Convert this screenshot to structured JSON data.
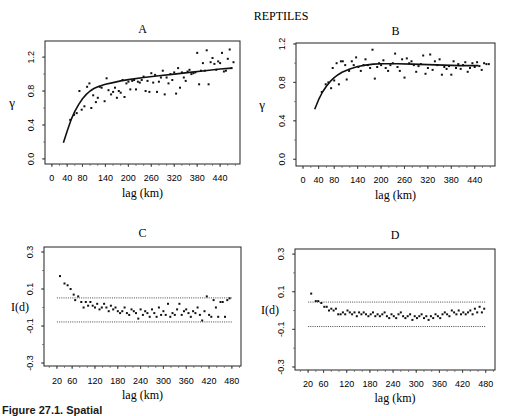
{
  "figure": {
    "main_title": "REPTILES",
    "caption_fragment": "Figure 27.1. Spatial"
  },
  "chart_data": [
    {
      "id": "A",
      "type": "scatter",
      "title": "A",
      "xlabel": "lag (km)",
      "ylabel": "γ",
      "xticks": [
        0,
        40,
        80,
        140,
        200,
        260,
        320,
        380,
        440
      ],
      "yticks": [
        0.0,
        0.4,
        0.8,
        1.2
      ],
      "ytick_labels": [
        "0.0",
        "0.4",
        "0.8",
        "1.2"
      ],
      "xlim": [
        -18,
        492
      ],
      "ylim": [
        -0.06,
        1.39
      ],
      "fit_curve": {
        "x": [
          30,
          40,
          50,
          60,
          70,
          80,
          90,
          100,
          110,
          120,
          140,
          160,
          180,
          200,
          240,
          280,
          320,
          360,
          400,
          440,
          470
        ],
        "y": [
          0.19,
          0.33,
          0.46,
          0.56,
          0.64,
          0.71,
          0.76,
          0.8,
          0.83,
          0.85,
          0.88,
          0.9,
          0.92,
          0.935,
          0.96,
          0.98,
          1.0,
          1.02,
          1.04,
          1.06,
          1.07
        ]
      },
      "points": {
        "x": [
          48,
          58,
          65,
          72,
          78,
          85,
          92,
          98,
          103,
          108,
          115,
          120,
          125,
          130,
          138,
          143,
          148,
          155,
          160,
          165,
          170,
          175,
          180,
          185,
          190,
          195,
          200,
          205,
          210,
          215,
          220,
          225,
          230,
          235,
          240,
          245,
          250,
          255,
          260,
          265,
          270,
          275,
          280,
          285,
          290,
          295,
          300,
          305,
          310,
          315,
          320,
          325,
          330,
          335,
          340,
          345,
          350,
          355,
          360,
          365,
          370,
          375,
          380,
          385,
          390,
          395,
          400,
          405,
          410,
          415,
          420,
          425,
          430,
          435,
          440,
          445,
          450,
          455,
          460,
          465,
          470,
          475
        ],
        "y": [
          0.46,
          0.52,
          0.54,
          0.8,
          0.58,
          0.62,
          0.85,
          0.89,
          0.6,
          0.75,
          0.67,
          0.72,
          0.85,
          0.84,
          0.68,
          0.95,
          0.81,
          0.76,
          0.79,
          0.84,
          0.72,
          0.8,
          0.78,
          0.93,
          0.73,
          0.89,
          0.91,
          0.82,
          0.92,
          0.93,
          0.82,
          0.91,
          0.9,
          0.93,
          0.97,
          0.8,
          0.92,
          0.79,
          1.01,
          0.9,
          0.99,
          0.79,
          0.91,
          0.96,
          1.04,
          0.76,
          0.96,
          0.89,
          1.0,
          0.93,
          1.02,
          0.77,
          1.07,
          0.84,
          1.02,
          0.96,
          0.92,
          1.03,
          1.05,
          1.0,
          1.01,
          1.02,
          1.25,
          0.88,
          1.04,
          1.13,
          1.04,
          1.28,
          0.88,
          1.14,
          1.19,
          1.12,
          1.05,
          1.15,
          1.13,
          1.25,
          1.03,
          1.04,
          1.18,
          1.29,
          1.07,
          1.14
        ]
      }
    },
    {
      "id": "B",
      "type": "scatter",
      "title": "B",
      "xlabel": "lag (km)",
      "ylabel": "γ",
      "xticks": [
        0,
        40,
        80,
        140,
        200,
        260,
        320,
        380,
        440
      ],
      "yticks": [
        0.0,
        0.4,
        0.8,
        1.2
      ],
      "ytick_labels": [
        "0.0",
        "0.4",
        "0.8",
        "1.2"
      ],
      "xlim": [
        -18,
        492
      ],
      "ylim": [
        -0.07,
        1.21
      ],
      "fit_curve": {
        "x": [
          30,
          40,
          50,
          60,
          70,
          80,
          90,
          100,
          120,
          140,
          160,
          180,
          200,
          240,
          280,
          320,
          360,
          400,
          440,
          450
        ],
        "y": [
          0.52,
          0.62,
          0.7,
          0.76,
          0.81,
          0.85,
          0.88,
          0.905,
          0.94,
          0.965,
          0.98,
          0.99,
          0.995,
          0.995,
          0.99,
          0.985,
          0.98,
          0.975,
          0.975,
          0.975
        ]
      },
      "points": {
        "x": [
          48,
          58,
          65,
          72,
          76,
          80,
          86,
          92,
          97,
          102,
          108,
          112,
          118,
          125,
          130,
          136,
          142,
          148,
          155,
          160,
          166,
          172,
          178,
          184,
          190,
          195,
          200,
          206,
          212,
          218,
          224,
          230,
          236,
          242,
          248,
          254,
          260,
          266,
          272,
          278,
          284,
          290,
          296,
          302,
          308,
          314,
          320,
          326,
          332,
          338,
          344,
          350,
          356,
          362,
          368,
          374,
          380,
          386,
          392,
          398,
          404,
          410,
          416,
          422,
          428,
          434,
          440,
          446,
          452,
          458,
          464,
          470,
          476
        ],
        "y": [
          0.7,
          0.78,
          0.8,
          0.74,
          0.95,
          0.82,
          1.0,
          0.78,
          1.02,
          1.02,
          0.98,
          0.83,
          0.92,
          1.02,
          0.98,
          1.06,
          0.96,
          0.92,
          0.98,
          1.04,
          0.98,
          0.95,
          1.14,
          0.84,
          0.96,
          1.0,
          0.98,
          1.03,
          0.95,
          0.92,
          0.98,
          1.0,
          1.1,
          0.96,
          0.92,
          1.04,
          0.85,
          1.05,
          1.0,
          1.02,
          0.98,
          0.91,
          0.97,
          0.99,
          1.08,
          0.89,
          0.95,
          1.09,
          0.93,
          1.02,
          0.98,
          1.04,
          0.88,
          0.96,
          0.94,
          0.97,
          0.88,
          1.02,
          0.95,
          0.99,
          0.94,
          0.98,
          1.01,
          0.91,
          0.95,
          1.0,
          0.96,
          1.01,
          0.97,
          0.93,
          1.0,
          0.99,
          0.99
        ]
      }
    },
    {
      "id": "C",
      "type": "scatter",
      "title": "C",
      "xlabel": "lag (km)",
      "ylabel": "I(d)",
      "xticks": [
        20,
        60,
        120,
        180,
        240,
        300,
        360,
        420,
        480
      ],
      "yticks": [
        -0.3,
        -0.1,
        0.1,
        0.3
      ],
      "ytick_labels": [
        "-0.3",
        "-0.1",
        "0.1",
        "0.3"
      ],
      "xlim": [
        -14,
        504
      ],
      "ylim": [
        -0.316,
        0.327
      ],
      "reference_lines": [
        0.052,
        -0.078
      ],
      "reference_line_xrange": [
        20,
        480
      ],
      "points": {
        "x": [
          28,
          40,
          48,
          56,
          64,
          68,
          76,
          84,
          90,
          96,
          102,
          108,
          114,
          120,
          126,
          132,
          138,
          144,
          150,
          156,
          162,
          168,
          174,
          180,
          186,
          192,
          198,
          204,
          210,
          216,
          222,
          228,
          234,
          240,
          246,
          252,
          258,
          264,
          270,
          276,
          282,
          288,
          294,
          300,
          306,
          312,
          318,
          324,
          330,
          336,
          342,
          348,
          354,
          360,
          366,
          372,
          378,
          384,
          390,
          396,
          402,
          408,
          414,
          420,
          426,
          432,
          438,
          444,
          450,
          456,
          462,
          468,
          474
        ],
        "y": [
          0.17,
          0.13,
          0.12,
          0.1,
          0.07,
          0.04,
          0.06,
          0.03,
          0.0,
          0.03,
          0.01,
          0.03,
          0.01,
          0.0,
          0.02,
          -0.01,
          0.0,
          0.02,
          0.0,
          -0.02,
          0.01,
          -0.01,
          0.0,
          -0.02,
          -0.03,
          -0.02,
          0.0,
          -0.03,
          -0.04,
          -0.01,
          -0.02,
          -0.03,
          -0.06,
          -0.01,
          -0.04,
          -0.02,
          -0.03,
          -0.05,
          -0.01,
          -0.03,
          -0.05,
          0.0,
          -0.04,
          -0.02,
          -0.04,
          0.02,
          -0.05,
          -0.03,
          -0.04,
          -0.01,
          0.02,
          -0.04,
          -0.02,
          -0.01,
          -0.03,
          -0.05,
          -0.02,
          -0.03,
          0.0,
          -0.04,
          -0.07,
          -0.02,
          0.06,
          -0.04,
          -0.05,
          0.04,
          0.0,
          -0.05,
          0.03,
          0.03,
          -0.05,
          0.04,
          0.05
        ]
      }
    },
    {
      "id": "D",
      "type": "scatter",
      "title": "D",
      "xlabel": "lag (km)",
      "ylabel": "I(d)",
      "xticks": [
        20,
        60,
        120,
        180,
        240,
        300,
        360,
        420,
        480
      ],
      "yticks": [
        -0.3,
        -0.1,
        0.1,
        0.3
      ],
      "ytick_labels": [
        "-0.3",
        "-0.1",
        "0.1",
        "0.3"
      ],
      "xlim": [
        -14,
        504
      ],
      "ylim": [
        -0.316,
        0.327
      ],
      "reference_lines": [
        0.045,
        -0.085
      ],
      "reference_line_xrange": [
        20,
        480
      ],
      "points": {
        "x": [
          28,
          40,
          46,
          54,
          62,
          68,
          74,
          80,
          86,
          92,
          98,
          104,
          110,
          116,
          122,
          128,
          134,
          140,
          146,
          152,
          158,
          164,
          170,
          176,
          182,
          188,
          194,
          200,
          206,
          212,
          218,
          224,
          230,
          236,
          242,
          248,
          254,
          260,
          266,
          272,
          278,
          284,
          290,
          296,
          302,
          308,
          314,
          320,
          326,
          332,
          338,
          344,
          350,
          356,
          362,
          368,
          374,
          380,
          386,
          392,
          398,
          404,
          410,
          416,
          422,
          428,
          434,
          440,
          446,
          452,
          458,
          464,
          470,
          476
        ],
        "y": [
          0.09,
          0.05,
          0.05,
          0.04,
          0.02,
          0.02,
          0.0,
          0.01,
          0.0,
          0.01,
          -0.02,
          -0.02,
          -0.01,
          -0.02,
          0.0,
          -0.01,
          -0.02,
          -0.01,
          -0.03,
          -0.01,
          -0.02,
          -0.01,
          -0.02,
          -0.03,
          -0.02,
          -0.01,
          -0.03,
          -0.02,
          -0.03,
          -0.02,
          -0.01,
          -0.03,
          -0.04,
          -0.02,
          -0.03,
          -0.04,
          -0.02,
          -0.01,
          -0.03,
          -0.04,
          -0.03,
          -0.02,
          -0.05,
          -0.03,
          -0.04,
          -0.03,
          -0.02,
          -0.04,
          -0.03,
          -0.05,
          -0.03,
          -0.04,
          -0.02,
          -0.03,
          -0.04,
          -0.02,
          -0.01,
          -0.02,
          -0.03,
          0.0,
          -0.01,
          -0.02,
          0.0,
          -0.02,
          -0.01,
          -0.02,
          -0.01,
          0.0,
          -0.02,
          0.01,
          -0.01,
          0.02,
          -0.01,
          0.01
        ]
      }
    }
  ]
}
